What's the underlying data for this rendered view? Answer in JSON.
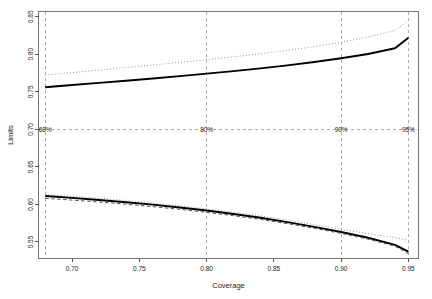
{
  "chart_data": {
    "type": "line",
    "title": "",
    "xlabel": "Coverage",
    "ylabel": "Limits",
    "xlim": [
      0.675,
      0.9575
    ],
    "ylim": [
      0.528,
      0.857
    ],
    "xticks": [
      0.7,
      0.75,
      0.8,
      0.85,
      0.9,
      0.95
    ],
    "xtick_labels": [
      "0.70",
      "0.75",
      "0.80",
      "0.85",
      "0.90",
      "0.95"
    ],
    "yticks": [
      0.55,
      0.6,
      0.65,
      0.7,
      0.75,
      0.8,
      0.85
    ],
    "ytick_labels": [
      "0.55",
      "0.60",
      "0.65",
      "0.70",
      "0.75",
      "0.80",
      "0.85"
    ],
    "grid": false,
    "legend": "none",
    "x": [
      0.68,
      0.7,
      0.72,
      0.74,
      0.76,
      0.78,
      0.8,
      0.82,
      0.84,
      0.86,
      0.88,
      0.9,
      0.92,
      0.94,
      0.95
    ],
    "series": [
      {
        "name": "upper-dotted",
        "style": "dotted",
        "color": "#9a9a9a",
        "values": [
          0.7725,
          0.7757,
          0.779,
          0.7823,
          0.7857,
          0.7892,
          0.7928,
          0.7966,
          0.8007,
          0.8052,
          0.8102,
          0.816,
          0.8229,
          0.8317,
          0.8447
        ]
      },
      {
        "name": "upper-solid",
        "style": "solid",
        "color": "#000000",
        "values": [
          0.7562,
          0.759,
          0.7619,
          0.7648,
          0.7678,
          0.7709,
          0.7742,
          0.7776,
          0.7813,
          0.7853,
          0.7897,
          0.7947,
          0.8004,
          0.808,
          0.8219
        ]
      },
      {
        "name": "lower-dotted",
        "style": "dotted",
        "color": "#9a9a9a",
        "values": [
          0.613,
          0.6107,
          0.6081,
          0.6052,
          0.6019,
          0.5983,
          0.5942,
          0.5897,
          0.5847,
          0.5792,
          0.5733,
          0.567,
          0.561,
          0.556,
          0.5522
        ]
      },
      {
        "name": "lower-solid",
        "style": "solid",
        "color": "#000000",
        "values": [
          0.6112,
          0.6087,
          0.606,
          0.603,
          0.5997,
          0.596,
          0.5919,
          0.5873,
          0.5822,
          0.5765,
          0.5702,
          0.5633,
          0.5556,
          0.5462,
          0.5372
        ]
      },
      {
        "name": "lower-dashed",
        "style": "dashed",
        "color": "#555555",
        "values": [
          0.6082,
          0.6058,
          0.6032,
          0.6003,
          0.5971,
          0.5935,
          0.5895,
          0.585,
          0.58,
          0.5744,
          0.5682,
          0.5614,
          0.5538,
          0.5445,
          0.5343
        ]
      }
    ],
    "vlines": [
      {
        "x": 0.68,
        "label": "68%",
        "style": "dashed",
        "color": "#9a9a9a"
      },
      {
        "x": 0.8,
        "label": "80%",
        "style": "dashed",
        "color": "#9a9a9a"
      },
      {
        "x": 0.9,
        "label": "90%",
        "style": "dashed",
        "color": "#9a9a9a"
      },
      {
        "x": 0.95,
        "label": "95%",
        "style": "dashed",
        "color": "#9a9a9a"
      }
    ],
    "hline": {
      "y": 0.7,
      "style": "dashed",
      "color": "#9a9a9a"
    },
    "annotation_y": 0.7
  }
}
